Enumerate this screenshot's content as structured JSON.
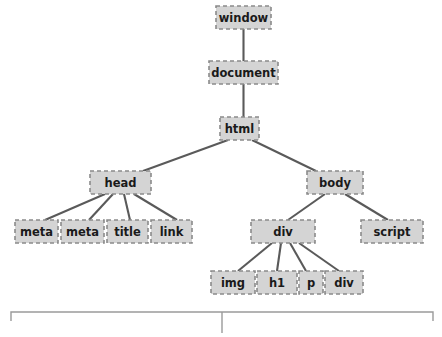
{
  "diagram": {
    "type": "tree-diagram",
    "colors": {
      "node_fill": "#d4d4d4",
      "node_border": "#8a8a8a",
      "edge": "#5a5a5a",
      "bracket": "#9a9a9a",
      "label_text": "#1a1a1a",
      "background": "#ffffff"
    },
    "nodes": [
      {
        "id": "window",
        "label": "window",
        "x": 216,
        "y": 6,
        "w": 55,
        "h": 23,
        "level": 0
      },
      {
        "id": "document",
        "label": "document",
        "x": 209,
        "y": 61,
        "w": 69,
        "h": 23,
        "level": 1
      },
      {
        "id": "html",
        "label": "html",
        "x": 220,
        "y": 117,
        "w": 39,
        "h": 23,
        "level": 2
      },
      {
        "id": "head",
        "label": "head",
        "x": 90,
        "y": 171,
        "w": 61,
        "h": 23,
        "level": 3
      },
      {
        "id": "body",
        "label": "body",
        "x": 307,
        "y": 171,
        "w": 56,
        "h": 23,
        "level": 3
      },
      {
        "id": "meta1",
        "label": "meta",
        "x": 15,
        "y": 220,
        "w": 43,
        "h": 23,
        "level": 4
      },
      {
        "id": "meta2",
        "label": "meta",
        "x": 61,
        "y": 220,
        "w": 43,
        "h": 23,
        "level": 4
      },
      {
        "id": "title",
        "label": "title",
        "x": 107,
        "y": 220,
        "w": 41,
        "h": 23,
        "level": 4
      },
      {
        "id": "link",
        "label": "link",
        "x": 151,
        "y": 220,
        "w": 41,
        "h": 23,
        "level": 4
      },
      {
        "id": "div1",
        "label": "div",
        "x": 251,
        "y": 220,
        "w": 64,
        "h": 23,
        "level": 4
      },
      {
        "id": "script",
        "label": "script",
        "x": 361,
        "y": 220,
        "w": 62,
        "h": 23,
        "level": 4
      },
      {
        "id": "img",
        "label": "img",
        "x": 211,
        "y": 271,
        "w": 44,
        "h": 23,
        "level": 5
      },
      {
        "id": "h1",
        "label": "h1",
        "x": 257,
        "y": 271,
        "w": 40,
        "h": 23,
        "level": 5
      },
      {
        "id": "p",
        "label": "p",
        "x": 299,
        "y": 271,
        "w": 24,
        "h": 23,
        "level": 5
      },
      {
        "id": "div2",
        "label": "div",
        "x": 325,
        "y": 271,
        "w": 38,
        "h": 23,
        "level": 5
      }
    ],
    "edges": [
      {
        "from": "window",
        "to": "document",
        "x1": 243.5,
        "y1": 29,
        "x2": 243.5,
        "y2": 61
      },
      {
        "from": "document",
        "to": "html",
        "x1": 243.5,
        "y1": 84,
        "x2": 243.5,
        "y2": 117
      },
      {
        "from": "html",
        "to": "head",
        "x1": 228,
        "y1": 140,
        "x2": 143,
        "y2": 171
      },
      {
        "from": "html",
        "to": "body",
        "x1": 252,
        "y1": 140,
        "x2": 316,
        "y2": 171
      },
      {
        "from": "head",
        "to": "meta1",
        "x1": 105,
        "y1": 194,
        "x2": 45,
        "y2": 220
      },
      {
        "from": "head",
        "to": "meta2",
        "x1": 113,
        "y1": 194,
        "x2": 89,
        "y2": 220
      },
      {
        "from": "head",
        "to": "title",
        "x1": 124,
        "y1": 194,
        "x2": 130,
        "y2": 220
      },
      {
        "from": "head",
        "to": "link",
        "x1": 134,
        "y1": 194,
        "x2": 177,
        "y2": 220
      },
      {
        "from": "body",
        "to": "div1",
        "x1": 325,
        "y1": 194,
        "x2": 288,
        "y2": 220
      },
      {
        "from": "body",
        "to": "script",
        "x1": 345,
        "y1": 194,
        "x2": 388,
        "y2": 220
      },
      {
        "from": "div1",
        "to": "img",
        "x1": 272,
        "y1": 243,
        "x2": 238,
        "y2": 271
      },
      {
        "from": "div1",
        "to": "h1",
        "x1": 281,
        "y1": 243,
        "x2": 277,
        "y2": 271
      },
      {
        "from": "div1",
        "to": "p",
        "x1": 290,
        "y1": 243,
        "x2": 306,
        "y2": 271
      },
      {
        "from": "div1",
        "to": "div2",
        "x1": 299,
        "y1": 243,
        "x2": 339,
        "y2": 271
      }
    ],
    "bracket": {
      "left_x": 11,
      "right_x": 433,
      "top_y": 312,
      "cap_height": 9,
      "tick_x": 222,
      "tick_bottom_y": 333
    }
  }
}
